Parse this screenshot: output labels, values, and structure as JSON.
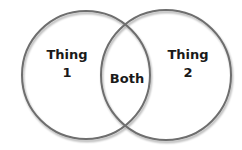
{
  "diagram": {
    "type": "venn",
    "sets": [
      {
        "name": "left",
        "label_line1": "Thing",
        "label_line2": "1"
      },
      {
        "name": "right",
        "label_line1": "Thing",
        "label_line2": "2"
      }
    ],
    "intersection": {
      "label": "Both"
    },
    "colors": {
      "stroke": "#6e6e6e",
      "text": "#1a1a1a",
      "background": "#ffffff"
    }
  }
}
